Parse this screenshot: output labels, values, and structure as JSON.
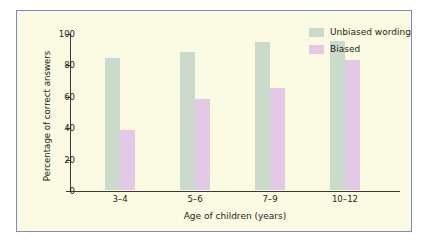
{
  "chart_data": {
    "type": "bar",
    "title": "",
    "xlabel": "Age of children (years)",
    "ylabel": "Percentage of correct answers",
    "categories": [
      "3–4",
      "5–6",
      "7–9",
      "10–12"
    ],
    "series": [
      {
        "name": "Unbiased wording",
        "values": [
          84,
          88,
          94,
          95
        ],
        "color": "#cbdbcb"
      },
      {
        "name": "Biased",
        "values": [
          38,
          58,
          65,
          83
        ],
        "color": "#e4c9e6"
      }
    ],
    "ylim": [
      0,
      100
    ],
    "yticks": [
      0,
      20,
      40,
      60,
      80,
      100
    ],
    "ytick_labels": [
      "0",
      "20",
      "40",
      "60",
      "80",
      "100"
    ],
    "grid": false,
    "legend_position": "top-right"
  },
  "legend": {
    "items": [
      {
        "label": "Unbiased wording",
        "swatch": "unbiased"
      },
      {
        "label": "Biased",
        "swatch": "biased"
      }
    ]
  },
  "colors": {
    "figure_background": "#fbfae2",
    "figure_border": "#7b8cc4",
    "axis": "#3a3a32",
    "text": "#231f1a",
    "unbiased": "#cbdbcb",
    "biased": "#e4c9e6"
  }
}
